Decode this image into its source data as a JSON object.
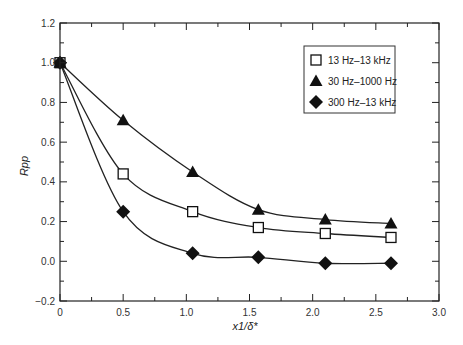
{
  "chart_data": {
    "type": "line",
    "title": "",
    "xlabel": "x1/δ*",
    "ylabel": "Rpp",
    "xlim": [
      0,
      3.0
    ],
    "ylim": [
      -0.2,
      1.2
    ],
    "xticks": [
      "0",
      "0.5",
      "1.0",
      "1.5",
      "2.0",
      "2.5",
      "3.0"
    ],
    "xtick_values": [
      0,
      0.5,
      1.0,
      1.5,
      2.0,
      2.5,
      3.0
    ],
    "yticks": [
      "1.2",
      "1.0",
      "0.8",
      "0.6",
      "0.4",
      "0.2",
      "0.0",
      "−0.2"
    ],
    "ytick_values": [
      1.2,
      1.0,
      0.8,
      0.6,
      0.4,
      0.2,
      0.0,
      -0.2
    ],
    "grid": false,
    "legend_position": "top-right",
    "series": [
      {
        "name": "13 Hz–13 kHz",
        "marker": "open-square",
        "x": [
          0,
          0.5,
          1.05,
          1.57,
          2.1,
          2.62
        ],
        "y": [
          1.0,
          0.44,
          0.25,
          0.17,
          0.14,
          0.12
        ]
      },
      {
        "name": "30 Hz–1000 Hz",
        "marker": "filled-triangle",
        "x": [
          0,
          0.5,
          1.05,
          1.57,
          2.1,
          2.62
        ],
        "y": [
          1.0,
          0.71,
          0.45,
          0.26,
          0.21,
          0.19
        ]
      },
      {
        "name": "300 Hz–13 kHz",
        "marker": "filled-diamond",
        "x": [
          0,
          0.5,
          1.05,
          1.57,
          2.1,
          2.62
        ],
        "y": [
          1.0,
          0.25,
          0.04,
          0.02,
          -0.01,
          -0.01
        ]
      }
    ]
  }
}
